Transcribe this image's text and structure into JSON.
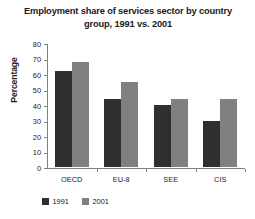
{
  "chart_data": {
    "type": "bar",
    "title": "Employment share of services sector by country group, 1991 vs. 2001",
    "title_line1": "Employment share of services sector by country",
    "title_line2": "group, 1991 vs. 2001",
    "xlabel": "",
    "ylabel": "Percentage",
    "ylim": [
      0,
      80
    ],
    "yticks": [
      0,
      10,
      20,
      30,
      40,
      50,
      60,
      70,
      80
    ],
    "ytick_labels": [
      "0",
      "10",
      "20",
      "30",
      "40",
      "50",
      "60",
      "70",
      "80"
    ],
    "categories": [
      "OECD",
      "EU-8",
      "SEE",
      "CIS"
    ],
    "grid": false,
    "legend_position": "bottom-left",
    "series": [
      {
        "name": "1991",
        "color": "#2f2f2f",
        "values": [
          62,
          44,
          40,
          30
        ]
      },
      {
        "name": "2001",
        "color": "#808080",
        "values": [
          68,
          55,
          44,
          44
        ]
      }
    ]
  }
}
